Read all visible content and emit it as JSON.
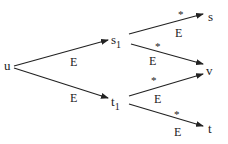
{
  "diagram": {
    "type": "directed-graph",
    "nodes": [
      {
        "id": "u",
        "label": "u",
        "subscript": ""
      },
      {
        "id": "s1",
        "label": "s",
        "subscript": "1"
      },
      {
        "id": "t1",
        "label": "t",
        "subscript": "1"
      },
      {
        "id": "s",
        "label": "s",
        "subscript": ""
      },
      {
        "id": "v",
        "label": "v",
        "subscript": ""
      },
      {
        "id": "t",
        "label": "t",
        "subscript": ""
      }
    ],
    "edges": [
      {
        "from": "u",
        "to": "s1",
        "label": "E",
        "star": ""
      },
      {
        "from": "u",
        "to": "t1",
        "label": "E",
        "star": ""
      },
      {
        "from": "s1",
        "to": "s",
        "label": "E",
        "star": "*"
      },
      {
        "from": "s1",
        "to": "v",
        "label": "E",
        "star": "*"
      },
      {
        "from": "t1",
        "to": "v",
        "label": "E",
        "star": "*"
      },
      {
        "from": "t1",
        "to": "t",
        "label": "E",
        "star": "*"
      }
    ]
  }
}
